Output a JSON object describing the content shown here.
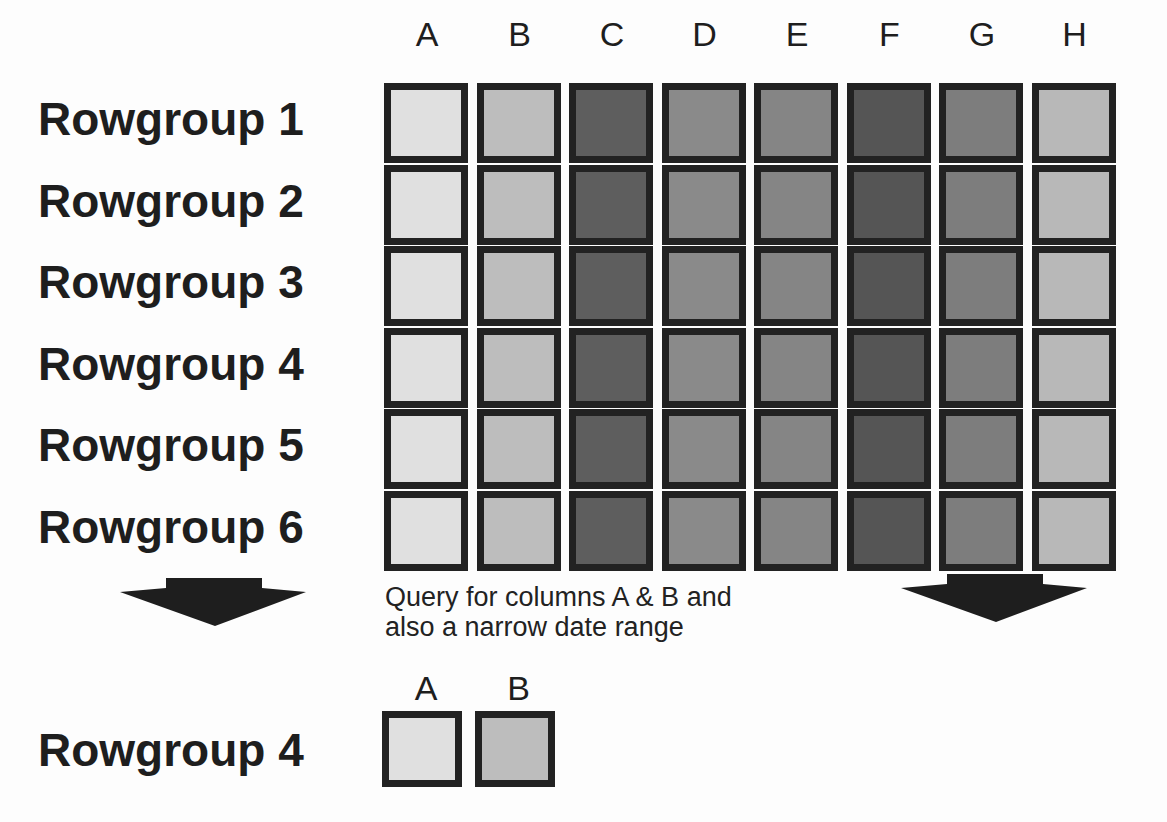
{
  "columns": [
    "A",
    "B",
    "C",
    "D",
    "E",
    "F",
    "G",
    "H"
  ],
  "column_shades": [
    "#e0e0e0",
    "#bdbdbd",
    "#5e5e5e",
    "#8a8a8a",
    "#858585",
    "#555555",
    "#7d7d7d",
    "#b8b8b8"
  ],
  "rowgroups": [
    "Rowgroup 1",
    "Rowgroup 2",
    "Rowgroup 3",
    "Rowgroup 4",
    "Rowgroup 5",
    "Rowgroup 6"
  ],
  "caption_line1": "Query for columns A & B and",
  "caption_line2": "also a narrow date range",
  "result": {
    "rowgroup": "Rowgroup 4",
    "columns": [
      "A",
      "B"
    ]
  }
}
